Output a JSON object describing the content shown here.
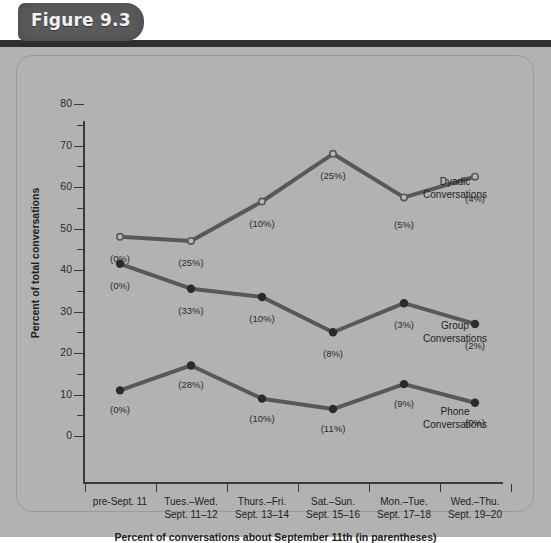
{
  "figure": {
    "badge_label": "Figure 9.3"
  },
  "chart_data": {
    "type": "line",
    "title": "",
    "xlabel": "Percent of conversations about September 11th (in parentheses)",
    "ylabel": "Percent of total conversations",
    "ylim": [
      0,
      85
    ],
    "ytick_values": [
      0,
      10,
      20,
      30,
      40,
      50,
      60,
      70,
      80
    ],
    "ytick_labels": [
      "0",
      "10",
      "20",
      "30",
      "40",
      "50",
      "60",
      "70",
      "80"
    ],
    "yminor_values": [
      5,
      15,
      25,
      35,
      45,
      55,
      65,
      75
    ],
    "grid": false,
    "legend_position": "right-inline",
    "categories": [
      "pre-Sept. 11",
      "Tues.–Wed.\nSept. 11–12",
      "Thurs.–Fri.\nSept. 13–14",
      "Sat.–Sun.\nSept. 15–16",
      "Mon.–Tue.\nSept. 17–18",
      "Wed.–Thu.\nSept. 19–20"
    ],
    "category_lines": [
      [
        "pre-Sept. 11",
        ""
      ],
      [
        "Tues.–Wed.",
        "Sept. 11–12"
      ],
      [
        "Thurs.–Fri.",
        "Sept. 13–14"
      ],
      [
        "Sat.–Sun.",
        "Sept. 15–16"
      ],
      [
        "Mon.–Tue.",
        "Sept. 17–18"
      ],
      [
        "Wed.–Thu.",
        "Sept. 19–20"
      ]
    ],
    "series": [
      {
        "name": "Dyadic Conversations",
        "label_lines": [
          "Dyadic",
          "Conversations"
        ],
        "marker": "open-circle",
        "values": [
          48,
          47,
          56.5,
          68,
          57.5,
          62.5
        ],
        "annotations": [
          "(0%)",
          "(25%)",
          "(10%)",
          "(25%)",
          "(5%)",
          "(4%)"
        ]
      },
      {
        "name": "Group Conversations",
        "label_lines": [
          "Group",
          "Conversations"
        ],
        "marker": "filled-circle",
        "values": [
          41.5,
          35.5,
          33.5,
          25,
          32,
          27
        ],
        "annotations": [
          "(0%)",
          "(33%)",
          "(10%)",
          "(8%)",
          "(3%)",
          "(2%)"
        ]
      },
      {
        "name": "Phone Conversations",
        "label_lines": [
          "Phone",
          "Conversations"
        ],
        "marker": "filled-circle",
        "values": [
          11,
          17,
          9,
          6.5,
          12.5,
          8
        ],
        "annotations": [
          "(0%)",
          "(28%)",
          "(10%)",
          "(11%)",
          "(9%)",
          "(0%)"
        ]
      }
    ],
    "colors": {
      "line": "#58585a",
      "marker_fill": "#2b2b2d",
      "marker_open_fill": "#b8b8b8",
      "axis": "#3a3a3c",
      "plate_background": "#b2b2b2",
      "badge_background": "#5b5b5d",
      "header_bar": "#2f2f31",
      "text": "#1d1d1f"
    }
  }
}
